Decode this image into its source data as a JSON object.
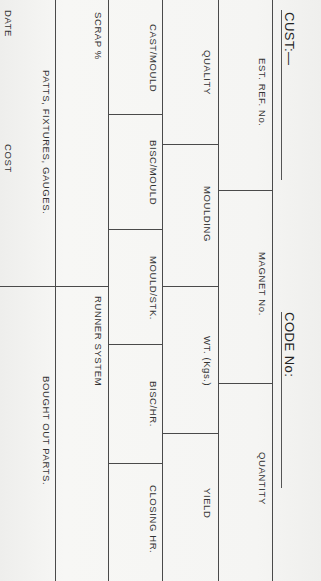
{
  "header": {
    "customer_label": "CUST:—",
    "code_label": "CODE No:"
  },
  "row_header": {
    "est_ref": "EST. REF. No.",
    "magnet": "MAGNET No.",
    "quantity": "QUANTITY"
  },
  "row_quality": {
    "quality": "QUALITY",
    "moulding": "MOULDING",
    "weight": "WT. (Kgs.)",
    "yield": "YIELD"
  },
  "row_times": {
    "cast_mould": "CAST/MOULD",
    "bisc_mould": "BISC/MOULD",
    "mould_stk": "MOULD/STK.",
    "bisc_hr": "BISC/HR.",
    "closing_hr": "CLOSING HR."
  },
  "row_scrap": {
    "scrap": "SCRAP %",
    "runner": "RUNNER SYSTEM"
  },
  "row_tooling": {
    "patterns": "PATTS, FIXTURES, GAUGES.",
    "bought_out": "BOUGHT OUT PARTS."
  },
  "row_footer": {
    "date": "DATE",
    "cost": "COST"
  }
}
